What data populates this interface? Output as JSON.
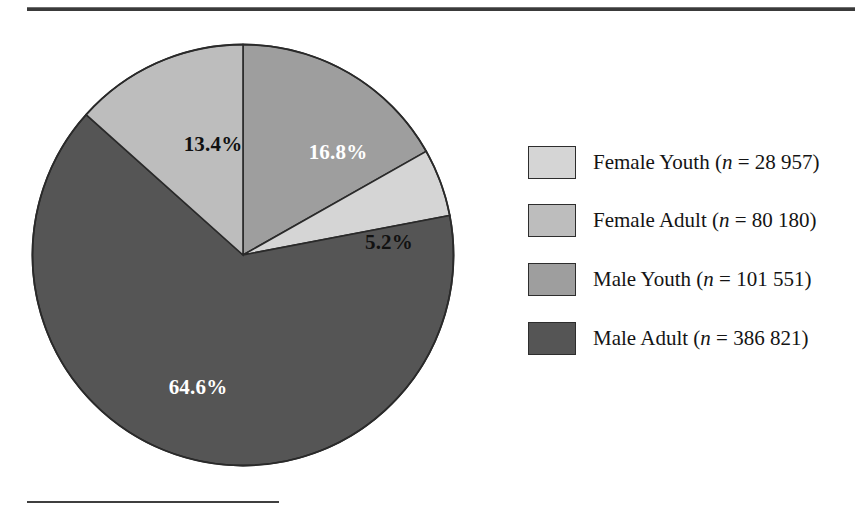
{
  "figure": {
    "background_color": "#ffffff",
    "rule_color": "#3a3a3a",
    "has_top_rule": true,
    "has_footnote_rule": true
  },
  "legend": {
    "position": "right",
    "items": [
      {
        "label": "Female Youth",
        "n_prefix": "(",
        "n_symbol": "n",
        "n_equals": " = ",
        "n_value": "28 957",
        "n_suffix": ")",
        "full_text": "Female Youth (n = 28 957)",
        "swatch_color": "#d5d5d5"
      },
      {
        "label": "Female Adult",
        "n_prefix": "(",
        "n_symbol": "n",
        "n_equals": " = ",
        "n_value": "80 180",
        "n_suffix": ")",
        "full_text": "Female Adult (n = 80 180)",
        "swatch_color": "#bdbdbd"
      },
      {
        "label": "Male Youth",
        "n_prefix": "(",
        "n_symbol": "n",
        "n_equals": " = ",
        "n_value": "101 551",
        "n_suffix": ")",
        "full_text": "Male Youth (n = 101 551)",
        "swatch_color": "#9e9e9e"
      },
      {
        "label": "Male Adult",
        "n_prefix": "(",
        "n_symbol": "n",
        "n_equals": " = ",
        "n_value": "386 821",
        "n_suffix": ")",
        "full_text": "Male Adult (n = 386 821)",
        "swatch_color": "#555555"
      }
    ]
  },
  "chart_data": {
    "type": "pie",
    "title": "",
    "xlabel": "",
    "ylabel": "",
    "legend_position": "right",
    "grid": false,
    "start_angle_deg": 0,
    "direction": "clockwise",
    "categories": [
      "Male Youth",
      "Female Youth",
      "Male Adult",
      "Female Adult"
    ],
    "values": [
      16.8,
      5.2,
      64.6,
      13.4
    ],
    "labels": [
      "16.8%",
      "5.2%",
      "64.6%",
      "13.4%"
    ],
    "counts": [
      101551,
      28957,
      386821,
      80180
    ],
    "colors": [
      "#9e9e9e",
      "#d5d5d5",
      "#555555",
      "#bdbdbd"
    ],
    "label_text_colors": [
      "#ffffff",
      "#111111",
      "#ffffff",
      "#111111"
    ],
    "slices": [
      {
        "name": "Male Youth",
        "percent": 16.8,
        "percent_label": "16.8%",
        "count": 101551,
        "count_label": "101 551",
        "color": "#9e9e9e",
        "label_color": "#ffffff",
        "start_deg": 0,
        "end_deg": 60.5,
        "label_x": 307,
        "label_y": 120
      },
      {
        "name": "Female Youth",
        "percent": 5.2,
        "percent_label": "5.2%",
        "count": 28957,
        "count_label": "28 957",
        "color": "#d5d5d5",
        "label_color": "#111111",
        "start_deg": 60.5,
        "end_deg": 79.2,
        "label_x": 358,
        "label_y": 210
      },
      {
        "name": "Male Adult",
        "percent": 64.6,
        "percent_label": "64.6%",
        "count": 386821,
        "count_label": "386 821",
        "color": "#555555",
        "label_color": "#ffffff",
        "start_deg": 79.2,
        "end_deg": 311.8,
        "label_x": 167,
        "label_y": 355
      },
      {
        "name": "Female Adult",
        "percent": 13.4,
        "percent_label": "13.4%",
        "count": 80180,
        "count_label": "80 180",
        "color": "#bdbdbd",
        "label_color": "#111111",
        "start_deg": 311.8,
        "end_deg": 360,
        "label_x": 182,
        "label_y": 112
      }
    ],
    "total_count": 597509,
    "total_percent": 100.0
  }
}
